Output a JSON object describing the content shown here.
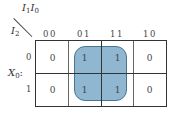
{
  "kmap": {
    "column_variables": {
      "base1": "I",
      "sub1": "1",
      "base2": "I",
      "sub2": "0"
    },
    "row_variable": {
      "base": "I",
      "sub": "2"
    },
    "output_label": {
      "base": "X",
      "sub": "0",
      "suffix": ":"
    },
    "column_headers": [
      "00",
      "01",
      "11",
      "10"
    ],
    "row_headers": [
      "0",
      "1"
    ],
    "cells": [
      [
        "0",
        "1",
        "1",
        "0"
      ],
      [
        "0",
        "1",
        "1",
        "0"
      ]
    ],
    "group": {
      "fill": "#8fb7d2",
      "border": "#4a7590",
      "covers": "columns 01,11 rows 0,1"
    }
  }
}
